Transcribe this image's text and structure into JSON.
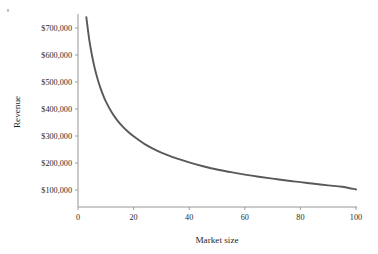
{
  "chart_data": {
    "type": "line",
    "title": "",
    "xlabel": "Market size",
    "ylabel": "Revenue",
    "xlim": [
      0,
      100
    ],
    "ylim": [
      0,
      740000
    ],
    "grid": false,
    "legend": null,
    "x_ticks": [
      0,
      20,
      40,
      60,
      80,
      100
    ],
    "x_tick_labels": [
      "0",
      "20",
      "40",
      "60",
      "80",
      "100"
    ],
    "y_ticks": [
      100000,
      200000,
      300000,
      400000,
      500000,
      600000,
      700000
    ],
    "y_tick_labels": [
      "$100,000",
      "$200,000",
      "$300,000",
      "$400,000",
      "$500,000",
      "$600,000",
      "$700,000"
    ],
    "series": [
      {
        "name": "Revenue",
        "color": "#595959",
        "x": [
          3,
          4,
          5,
          6,
          7,
          8,
          9,
          10,
          12,
          14,
          16,
          18,
          20,
          24,
          28,
          32,
          36,
          40,
          45,
          50,
          55,
          60,
          65,
          70,
          75,
          80,
          85,
          90,
          95,
          100
        ],
        "values": [
          740000,
          660000,
          600000,
          552000,
          513000,
          480000,
          452000,
          428000,
          390000,
          360000,
          336000,
          316000,
          299000,
          270000,
          248000,
          230000,
          215000,
          202000,
          188000,
          176000,
          166000,
          157000,
          149000,
          142000,
          135000,
          129000,
          123000,
          117000,
          112000,
          102000
        ]
      }
    ]
  },
  "axis": {
    "x_title": "Market size",
    "y_title": "Revenue"
  }
}
